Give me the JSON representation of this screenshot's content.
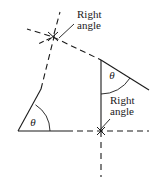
{
  "figure": {
    "width": 153,
    "height": 184,
    "background_color": "#ffffff",
    "line_color": "#1a1a1a",
    "labels": {
      "right_angle_top": {
        "line1": "Right",
        "line2": "angle"
      },
      "right_angle_bottom": {
        "line1": "Right",
        "line2": "angle"
      },
      "theta_left": "θ",
      "theta_right": "θ"
    }
  }
}
